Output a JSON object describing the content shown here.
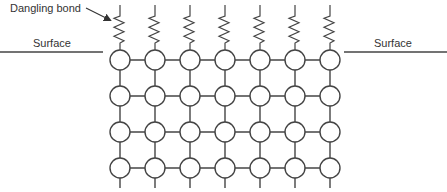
{
  "diagram": {
    "labels": {
      "dangling_bond": "Dangling bond",
      "surface_left": "Surface",
      "surface_right": "Surface"
    },
    "lattice": {
      "columns": 7,
      "rows": 4,
      "col_x": [
        120,
        155,
        190,
        225,
        260,
        295,
        330
      ],
      "row_y": [
        60,
        96,
        132,
        168
      ],
      "atom_radius": 10
    },
    "dangling_bonds_count": 7,
    "colors": {
      "line": "#444444",
      "atom_fill": "#ffffff",
      "text": "#333333"
    }
  }
}
